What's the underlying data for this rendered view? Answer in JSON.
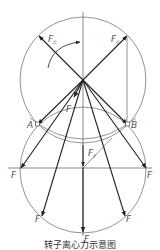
{
  "diagram": {
    "type": "force-vector-diagram",
    "labels": {
      "centrifugal_force_left": "F",
      "centrifugal_force_left_sub": "c",
      "centrifugal_force_right": "F",
      "centrifugal_force_right_sub": "c",
      "point_a": "A",
      "point_b": "B",
      "force_inner": "F",
      "resultant": "F",
      "resultant_sub": "r",
      "force_left_horizontal": "F",
      "force_right_horizontal": "F",
      "force_lower_left": "F",
      "force_lower_right": "F",
      "force_bottom": "F"
    },
    "colors": {
      "line": "#333333",
      "circle": "#777777",
      "label": "#555555"
    }
  },
  "caption": "转子离心力示意图"
}
